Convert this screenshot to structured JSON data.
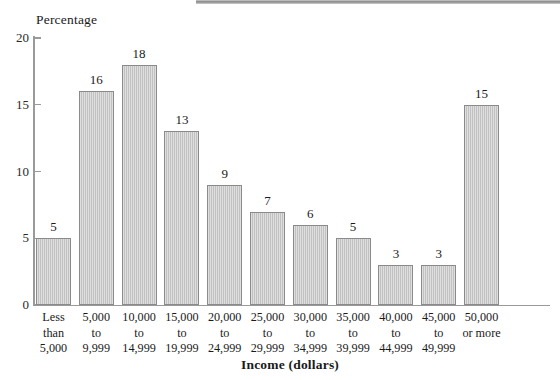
{
  "figure": {
    "background_color": "#ffffff",
    "bar_fill_color": "#cacaca",
    "bar_border_color": "#8a8a8a",
    "axis_color": "#9a9a9a",
    "scan_strip_color": "#8d8d8d"
  },
  "chart_data": {
    "type": "bar",
    "title": "",
    "xlabel": "Income (dollars)",
    "ylabel": "Percentage",
    "categories": [
      "Less\nthan\n5,000",
      "5,000\nto\n9,999",
      "10,000\nto\n14,999",
      "15,000\nto\n19,999",
      "20,000\nto\n24,999",
      "25,000\nto\n29,999",
      "30,000\nto\n34,999",
      "35,000\nto\n39,999",
      "40,000\nto\n44,999",
      "45,000\nto\n49,999",
      "50,000\nor more"
    ],
    "category_lines": [
      [
        "Less",
        "than",
        "5,000"
      ],
      [
        "5,000",
        "to",
        "9,999"
      ],
      [
        "10,000",
        "to",
        "14,999"
      ],
      [
        "15,000",
        "to",
        "19,999"
      ],
      [
        "20,000",
        "to",
        "24,999"
      ],
      [
        "25,000",
        "to",
        "29,999"
      ],
      [
        "30,000",
        "to",
        "34,999"
      ],
      [
        "35,000",
        "to",
        "39,999"
      ],
      [
        "40,000",
        "to",
        "44,999"
      ],
      [
        "45,000",
        "to",
        "49,999"
      ],
      [
        "50,000",
        "or more"
      ]
    ],
    "values": [
      5,
      16,
      18,
      13,
      9,
      7,
      6,
      5,
      3,
      3,
      15
    ],
    "value_labels": [
      "5",
      "16",
      "18",
      "13",
      "9",
      "7",
      "6",
      "5",
      "3",
      "3",
      "15"
    ],
    "ylim": [
      0,
      20
    ],
    "yticks": [
      0,
      5,
      10,
      15,
      20
    ],
    "ytick_labels": [
      "0",
      "5",
      "10",
      "15",
      "20"
    ],
    "grid": false,
    "legend": false,
    "legend_position": "none"
  }
}
